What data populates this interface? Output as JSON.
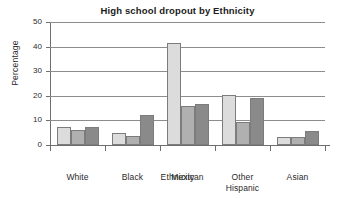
{
  "chart_data": {
    "type": "bar",
    "title": "High school dropout by Ethnicity",
    "xlabel": "Ethnicity",
    "ylabel": "Percentage",
    "categories": [
      "White",
      "Black",
      "Mexican",
      "Other Hispanic",
      "Asian"
    ],
    "category_lines": [
      [
        "White"
      ],
      [
        "Black"
      ],
      [
        "Mexican"
      ],
      [
        "Other",
        "Hispanic"
      ],
      [
        "Asian"
      ]
    ],
    "series": [
      {
        "name": "series-1",
        "color": "#dcdcdc",
        "values": [
          7.5,
          5.0,
          41.3,
          20.3,
          3.3
        ]
      },
      {
        "name": "series-2",
        "color": "#b0b0b0",
        "values": [
          6.3,
          3.5,
          15.7,
          9.2,
          3.4
        ]
      },
      {
        "name": "series-3",
        "color": "#8a8a8a",
        "values": [
          7.2,
          12.3,
          16.7,
          19.2,
          5.9
        ]
      }
    ],
    "ylim": [
      0,
      50
    ],
    "yticks": [
      0,
      10,
      20,
      30,
      40,
      50
    ],
    "ytick_labels": [
      "0",
      "10",
      "20",
      "30",
      "40",
      "50"
    ],
    "grid": true,
    "legend": "none"
  }
}
